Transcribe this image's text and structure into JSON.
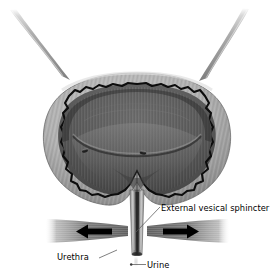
{
  "figure": {
    "style": "grayscale medical illustration",
    "background_color": "#ffffff"
  },
  "labels": {
    "sphincter": "External vesical sphincter",
    "urethra": "Urethra",
    "urine": "Urine"
  },
  "structures": [
    {
      "name": "left-ureter",
      "label": ""
    },
    {
      "name": "right-ureter",
      "label": ""
    },
    {
      "name": "bladder-wall",
      "label": ""
    },
    {
      "name": "bladder-lumen",
      "label": ""
    },
    {
      "name": "left-ureteric-orifice",
      "label": ""
    },
    {
      "name": "right-ureteric-orifice",
      "label": ""
    },
    {
      "name": "urethra-tube",
      "label": ""
    },
    {
      "name": "sphincter-band-left",
      "label": ""
    },
    {
      "name": "sphincter-band-right",
      "label": ""
    },
    {
      "name": "urine-droplet",
      "label": ""
    }
  ],
  "colors": {
    "background": "#ffffff",
    "wall_outer": "#a8a8a8",
    "wall_mucosa": "#111111",
    "lumen": "#5a5a5a",
    "ureter": "#9a9a9a",
    "sphincter": "#7d7d7d",
    "arrow": "#000000",
    "text": "#000000",
    "leader": "#555555"
  },
  "annotations": {
    "arrow_left_direction": "left",
    "arrow_right_direction": "right",
    "leader_lines": 3
  }
}
